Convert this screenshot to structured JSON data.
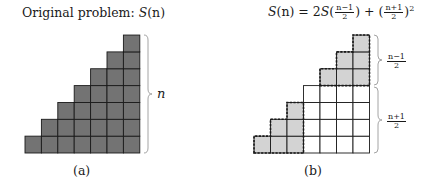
{
  "panel_a": {
    "title_prefix": "Original problem: ",
    "title_func": "S",
    "title_arg": "(n)",
    "brace_label": "n",
    "caption": "(a)",
    "grid": {
      "columns": 7,
      "rows": 7,
      "fill": "#737373",
      "stroke": "#1a1a1a"
    }
  },
  "panel_b": {
    "formula": {
      "lhs_func": "S",
      "lhs_arg": "(n)",
      "eq": " = 2",
      "rec_func": "S",
      "rec_open": "(",
      "rec_num": "n−1",
      "rec_den": "2",
      "rec_close": ")",
      "plus": " + (",
      "sq_num": "n+1",
      "sq_den": "2",
      "sq_close": ")",
      "exp": "2"
    },
    "upper_brace_label": {
      "num": "n−1",
      "den": "2"
    },
    "lower_brace_label": {
      "num": "n+1",
      "den": "2"
    },
    "caption": "(b)",
    "grid": {
      "columns": 7,
      "rows": 7,
      "shaded_fill": "#d3d3d3",
      "plain_fill": "#ffffff",
      "stroke": "#1a1a1a"
    }
  }
}
